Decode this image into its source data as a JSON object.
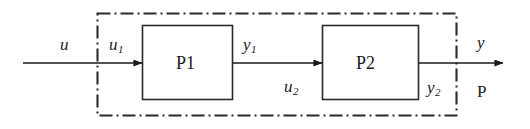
{
  "diagram": {
    "type": "block-diagram",
    "background_color": "#ffffff",
    "line_color": "#1a1a1a",
    "boundary_style": "dash-dot",
    "blocks": [
      {
        "id": "P1",
        "label": "P1",
        "x": 142,
        "y": 25,
        "width": 91,
        "height": 75
      },
      {
        "id": "P2",
        "label": "P2",
        "x": 322,
        "y": 25,
        "width": 97,
        "height": 75
      }
    ],
    "boundary": {
      "label": "P",
      "x": 97,
      "y": 13,
      "width": 360,
      "height": 103
    },
    "signals": {
      "external_input": {
        "base": "u",
        "sub": ""
      },
      "p1_input": {
        "base": "u",
        "sub": "1"
      },
      "p1_output": {
        "base": "y",
        "sub": "1"
      },
      "p2_input": {
        "base": "u",
        "sub": "2"
      },
      "p2_output": {
        "base": "y",
        "sub": "2"
      },
      "external_output": {
        "base": "y",
        "sub": ""
      }
    },
    "arrows": [
      {
        "name": "input-arrow",
        "x1": 23,
        "y1": 63,
        "x2": 142,
        "y2": 63
      },
      {
        "name": "interconnect-arrow",
        "x1": 233,
        "y1": 63,
        "x2": 322,
        "y2": 63
      },
      {
        "name": "output-arrow",
        "x1": 419,
        "y1": 63,
        "x2": 503,
        "y2": 63
      }
    ]
  }
}
